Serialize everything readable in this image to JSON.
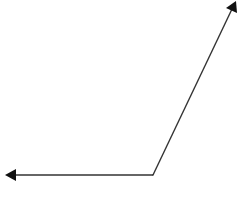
{
  "diagram": {
    "type": "angle",
    "stroke_color": "#333333",
    "arrow_color": "#111111",
    "background": "#ffffff",
    "vertex": {
      "x": 153,
      "y": 175
    },
    "rays": [
      {
        "name": "ray-left",
        "end": {
          "x": 6,
          "y": 175
        },
        "direction": "left"
      },
      {
        "name": "ray-up-right",
        "end": {
          "x": 236,
          "y": 2
        },
        "direction": "up-right"
      }
    ]
  }
}
